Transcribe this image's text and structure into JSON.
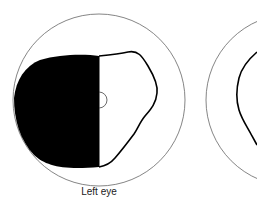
{
  "diagram": {
    "type": "visual-field-diagram",
    "left_eye": {
      "label": "Left eye",
      "field_status": "left half of visual field blacked out (hemianopia)",
      "outer_circle_color": "#555555",
      "field_outline_color": "#000000",
      "defect_fill_color": "#000000"
    },
    "right_eye": {
      "label": "",
      "partially_visible": true
    }
  }
}
